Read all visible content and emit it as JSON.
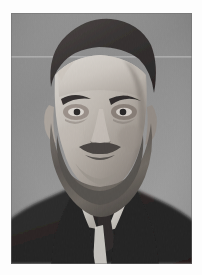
{
  "canvas": {
    "width": 202,
    "height": 275,
    "background_color": "#fdfdfd",
    "description": "Single black-and-white vintage portrait photograph centered on a near-white page background."
  },
  "photograph": {
    "name": "portrait-photograph",
    "alt_text": "Black and white studio portrait of a balding bearded man in a dark suit with a white collar and dark tie, facing the viewer.",
    "frame": {
      "left": 11,
      "top": 13,
      "width": 181,
      "height": 251
    },
    "medium": "monochrome photograph",
    "orientation": "portrait",
    "tonality": "grayscale",
    "era_look": "early twentieth century studio photography",
    "colors": {
      "page_background": "#fdfdfd",
      "backdrop_light": "#a6a6a6",
      "backdrop_mid": "#8b8b8b",
      "backdrop_dark": "#6f6f6f",
      "hair_dark": "#231f1f",
      "suit_black": "#141313",
      "skin_light": "#dcd6cf",
      "skin_mid": "#b3aaa2",
      "skin_shadow": "#7d746d",
      "beard_gray": "#8e8880",
      "beard_dark": "#3b3633",
      "collar_white": "#f2f0ec",
      "scanline": "#c9c9c9"
    },
    "subject": {
      "pose": "head and shoulders, frontal, head slightly turned",
      "expression": "stern, direct gaze",
      "hair": "dark hair receding at the temples, swept back, high forehead",
      "facial_hair": "full long beard and moustache, graying at the chin",
      "eyes": "deep set, heavy dark brows, intense stare",
      "attire": "dark formal jacket, white winged collar shirt, dark necktie"
    },
    "artifacts": [
      {
        "name": "horizontal-scan-line",
        "description": "Faint light horizontal line crossing the backdrop",
        "y": 44
      },
      {
        "name": "vignette",
        "description": "Subtle darkening toward the upper corners of the backdrop"
      },
      {
        "name": "film-grain",
        "description": "Fine vertical grain texture across the print"
      }
    ],
    "composition": {
      "head_center_x": 97,
      "head_center_y": 105,
      "crop": "top of head slightly cropped by upper frame edge",
      "shoulders_fill_bottom": true
    }
  }
}
